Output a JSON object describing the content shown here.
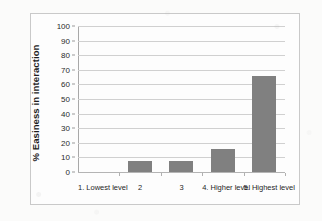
{
  "chart_data": {
    "type": "bar",
    "title": "",
    "subtitle": "",
    "xlabel": "",
    "ylabel": "% Easiness in interaction",
    "categories": [
      "1. Lowest level",
      "2",
      "3",
      "4. Higher level",
      "5. Highest level"
    ],
    "values": [
      0,
      7.5,
      7.5,
      16,
      66
    ],
    "series": [
      {
        "name": "% Easiness in interaction",
        "values": [
          0,
          7.5,
          7.5,
          16,
          66
        ]
      }
    ],
    "ylim": [
      0,
      100
    ],
    "ytick_values": [
      0,
      10,
      20,
      30,
      40,
      50,
      60,
      70,
      80,
      90,
      100
    ],
    "ytick_labels": [
      "0",
      "10",
      "20",
      "30",
      "40",
      "50",
      "60",
      "70",
      "80",
      "90",
      "100"
    ],
    "grid": "horizontal",
    "legend": "none",
    "bar_color": "#808080",
    "gridline_color": "#d0d0d0",
    "axis_color": "#a8a8a8",
    "frame_color": "#c9c9c9",
    "background": "#fdfdfd"
  }
}
